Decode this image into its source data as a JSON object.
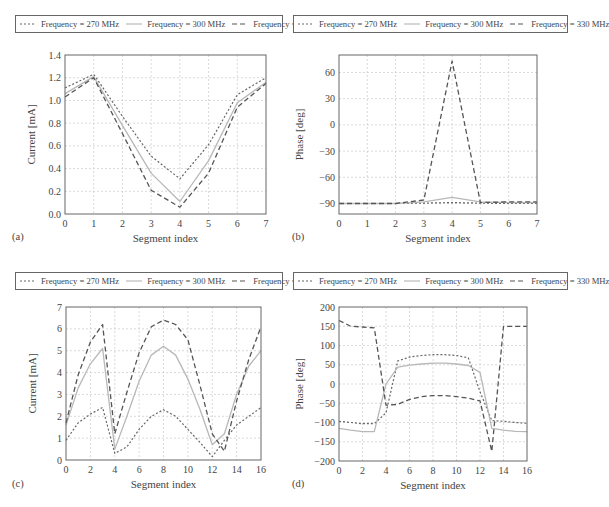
{
  "legend": {
    "entries": [
      {
        "label": "Frequency = 270 MHz",
        "style": "dotted"
      },
      {
        "label": "Frequency = 300 MHz",
        "style": "solid"
      },
      {
        "label": "Frequency = 330 MHz",
        "style": "dashed"
      }
    ]
  },
  "colors": {
    "series_270": "#666666",
    "series_300": "#b8b8b8",
    "series_330": "#555555",
    "grid": "#c8c8c8",
    "axis": "#666666"
  },
  "chart_data": [
    {
      "panel": "(a)",
      "type": "line",
      "xlabel": "Segment index",
      "ylabel": "Current [mA]",
      "xlim": [
        0,
        7
      ],
      "ylim": [
        0,
        1.4
      ],
      "xticks": [
        0,
        1,
        2,
        3,
        4,
        5,
        6,
        7
      ],
      "yticks": [
        0.0,
        0.2,
        0.4,
        0.6,
        0.8,
        1.0,
        1.2,
        1.4
      ],
      "ytick_labels": [
        "0.0",
        "0.2",
        "0.4",
        "0.6",
        "0.8",
        "1.0",
        "1.2",
        "1.4"
      ],
      "grid": true,
      "legend_position": "top",
      "x": [
        0,
        1,
        2,
        3,
        4,
        5,
        6,
        7
      ],
      "series": [
        {
          "name": "Frequency = 270 MHz",
          "values": [
            1.11,
            1.23,
            0.86,
            0.51,
            0.31,
            0.61,
            1.05,
            1.2
          ]
        },
        {
          "name": "Frequency = 300 MHz",
          "values": [
            1.06,
            1.21,
            0.78,
            0.36,
            0.11,
            0.47,
            0.98,
            1.16
          ]
        },
        {
          "name": "Frequency = 330 MHz",
          "values": [
            1.03,
            1.2,
            0.71,
            0.21,
            0.06,
            0.36,
            0.94,
            1.15
          ]
        }
      ]
    },
    {
      "panel": "(b)",
      "type": "line",
      "xlabel": "Segment index",
      "ylabel": "Phase [deg]",
      "xlim": [
        0,
        7
      ],
      "ylim": [
        -102,
        80
      ],
      "xticks": [
        0,
        1,
        2,
        3,
        4,
        5,
        6,
        7
      ],
      "yticks": [
        -90,
        -60,
        -30,
        0,
        30,
        60
      ],
      "ytick_labels": [
        "-90",
        "-60",
        "-30",
        "0",
        "30",
        "60"
      ],
      "grid": true,
      "legend_position": "top",
      "x": [
        0,
        1,
        2,
        3,
        4,
        5,
        6,
        7
      ],
      "series": [
        {
          "name": "Frequency = 270 MHz",
          "values": [
            -90,
            -90,
            -90,
            -89.5,
            -89,
            -89.5,
            -90,
            -90
          ]
        },
        {
          "name": "Frequency = 300 MHz",
          "values": [
            -90,
            -90,
            -90,
            -88,
            -83,
            -88,
            -89,
            -89
          ]
        },
        {
          "name": "Frequency = 330 MHz",
          "values": [
            -90,
            -90,
            -90,
            -86,
            73,
            -89,
            -88,
            -88
          ]
        }
      ]
    },
    {
      "panel": "(c)",
      "type": "line",
      "xlabel": "Segment index",
      "ylabel": "Current [mA]",
      "xlim": [
        0,
        16
      ],
      "ylim": [
        0,
        7
      ],
      "xticks": [
        0,
        2,
        4,
        6,
        8,
        10,
        12,
        14,
        16
      ],
      "yticks": [
        0,
        1,
        2,
        3,
        4,
        5,
        6,
        7
      ],
      "ytick_labels": [
        "0",
        "1",
        "2",
        "3",
        "4",
        "5",
        "6",
        "7"
      ],
      "grid": true,
      "legend_position": "top",
      "x": [
        0,
        1,
        2,
        3,
        4,
        5,
        6,
        7,
        8,
        9,
        10,
        11,
        12,
        13,
        14,
        15,
        16
      ],
      "series": [
        {
          "name": "Frequency = 270 MHz",
          "values": [
            0.9,
            1.7,
            2.1,
            2.4,
            0.3,
            0.6,
            1.4,
            2.0,
            2.3,
            2.0,
            1.4,
            0.8,
            0.15,
            0.9,
            1.6,
            2.0,
            2.4
          ]
        },
        {
          "name": "Frequency = 300 MHz",
          "values": [
            1.6,
            3.3,
            4.4,
            5.1,
            0.5,
            2.0,
            3.6,
            4.8,
            5.2,
            4.8,
            3.7,
            2.3,
            0.7,
            1.2,
            3.0,
            4.3,
            5.0
          ]
        },
        {
          "name": "Frequency = 330 MHz",
          "values": [
            1.7,
            3.9,
            5.4,
            6.2,
            1.2,
            3.1,
            4.9,
            6.1,
            6.4,
            6.2,
            5.5,
            3.4,
            1.2,
            0.4,
            2.7,
            4.6,
            6.1
          ]
        }
      ]
    },
    {
      "panel": "(d)",
      "type": "line",
      "xlabel": "Segment index",
      "ylabel": "Phase [deg]",
      "xlim": [
        0,
        16
      ],
      "ylim": [
        -200,
        200
      ],
      "xticks": [
        0,
        2,
        4,
        6,
        8,
        10,
        12,
        14,
        16
      ],
      "yticks": [
        -200,
        -150,
        -100,
        -50,
        0,
        50,
        100,
        150,
        200
      ],
      "ytick_labels": [
        "-200",
        "-150",
        "-100",
        "-50",
        "0",
        "50",
        "100",
        "150",
        "200"
      ],
      "grid": true,
      "legend_position": "top",
      "x": [
        0,
        1,
        2,
        3,
        4,
        5,
        6,
        7,
        8,
        9,
        10,
        11,
        12,
        13,
        14,
        15,
        16
      ],
      "series": [
        {
          "name": "Frequency = 270 MHz",
          "values": [
            -97,
            -100,
            -103,
            -103,
            -75,
            60,
            70,
            74,
            76,
            76,
            74,
            68,
            -20,
            -95,
            -97,
            -100,
            -102
          ]
        },
        {
          "name": "Frequency = 300 MHz",
          "values": [
            -115,
            -120,
            -124,
            -124,
            0,
            44,
            49,
            52,
            54,
            54,
            52,
            48,
            30,
            -115,
            -120,
            -123,
            -124
          ]
        },
        {
          "name": "Frequency = 330 MHz",
          "values": [
            165,
            150,
            148,
            146,
            -55,
            -53,
            -40,
            -33,
            -30,
            -30,
            -33,
            -37,
            -44,
            -175,
            150,
            150,
            150
          ]
        }
      ]
    }
  ]
}
